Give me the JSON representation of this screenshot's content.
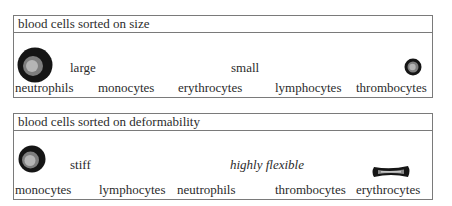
{
  "size_panel": {
    "title": "blood cells sorted on size",
    "scale_left": "large",
    "scale_right": "small",
    "cells": [
      "neutrophils",
      "monocytes",
      "erythrocytes",
      "lymphocytes",
      "thrombocytes"
    ],
    "icons": {
      "left": "large-cell-icon",
      "right": "small-cell-icon"
    }
  },
  "deform_panel": {
    "title": "blood cells sorted on deformability",
    "scale_left": "stiff",
    "scale_right": "highly flexible",
    "cells": [
      "monocytes",
      "lymphocytes",
      "neutrophils",
      "thrombocytes",
      "erythrocytes"
    ],
    "icons": {
      "left": "stiff-cell-icon",
      "right": "flexible-cell-icon"
    }
  },
  "colors": {
    "outer": "#151515",
    "middle": "#7e7e7e",
    "inner": "#b5b5b5",
    "border": "#7a7a7a"
  }
}
